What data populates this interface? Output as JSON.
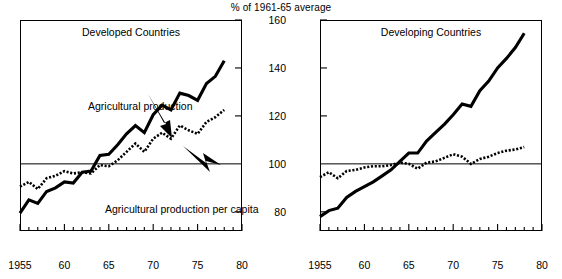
{
  "figure": {
    "suptitle": "% of 1961-65 average",
    "ylabels": [
      "160",
      "140",
      "120",
      "100",
      "80"
    ],
    "annotation_production": "Agricultural production",
    "annotation_per_capita": "Agricultural production per capita",
    "xlabels": [
      "1955",
      "60",
      "65",
      "70",
      "75",
      "80"
    ]
  },
  "panels": {
    "left": {
      "title": "Developed Countries"
    },
    "right": {
      "title": "Developing Countries"
    }
  },
  "chart_data": {
    "type": "line",
    "title": "% of 1961-65 average",
    "xlabel": "",
    "ylabel": "% of 1961-65 average",
    "xlim": [
      1955,
      1980
    ],
    "ylim": [
      72,
      160
    ],
    "yticks": [
      80,
      100,
      120,
      140,
      160
    ],
    "xticks": [
      1955,
      1960,
      1965,
      1970,
      1975,
      1980
    ],
    "xtick_labels": [
      "1955",
      "60",
      "65",
      "70",
      "75",
      "80"
    ],
    "grid": false,
    "legend": "none",
    "reference_line": 100,
    "annotations": [
      {
        "text": "Agricultural production",
        "panel": "left",
        "points_to": "solid-line"
      },
      {
        "text": "Agricultural production per capita",
        "panel": "left",
        "points_to": "dotted-line"
      }
    ],
    "panels": [
      {
        "name": "Developed Countries",
        "x": [
          1955,
          1956,
          1957,
          1958,
          1959,
          1960,
          1961,
          1962,
          1963,
          1964,
          1965,
          1966,
          1967,
          1968,
          1969,
          1970,
          1971,
          1972,
          1973,
          1974,
          1975,
          1976,
          1977,
          1978
        ],
        "series": [
          {
            "name": "Agricultural production",
            "style": "solid",
            "values": [
              79.5,
              85.0,
              83.5,
              88.5,
              90.0,
              92.5,
              92.0,
              96.5,
              97.0,
              103.5,
              104.0,
              108.0,
              112.5,
              116.0,
              113.0,
              120.5,
              124.5,
              122.5,
              129.5,
              128.5,
              126.5,
              133.5,
              136.5,
              143.0
            ]
          },
          {
            "name": "Agricultural production per capita",
            "style": "dotted",
            "values": [
              90.5,
              92.5,
              89.5,
              94.0,
              95.0,
              97.0,
              96.0,
              96.5,
              96.0,
              99.5,
              99.0,
              101.5,
              105.0,
              108.5,
              105.0,
              110.5,
              113.0,
              110.5,
              116.0,
              114.0,
              112.5,
              117.5,
              119.5,
              122.5
            ]
          }
        ]
      },
      {
        "name": "Developing Countries",
        "x": [
          1955,
          1956,
          1957,
          1958,
          1959,
          1960,
          1961,
          1962,
          1963,
          1964,
          1965,
          1966,
          1967,
          1968,
          1969,
          1970,
          1971,
          1972,
          1973,
          1974,
          1975,
          1976,
          1977,
          1978
        ],
        "series": [
          {
            "name": "Agricultural production",
            "style": "solid",
            "values": [
              78.0,
              80.5,
              81.5,
              86.0,
              88.5,
              90.5,
              92.5,
              95.0,
              97.5,
              101.0,
              104.5,
              104.5,
              109.5,
              113.0,
              116.5,
              120.5,
              125.0,
              124.0,
              130.5,
              134.5,
              140.0,
              144.0,
              148.5,
              154.5
            ]
          },
          {
            "name": "Agricultural production per capita",
            "style": "dotted",
            "values": [
              94.5,
              96.5,
              94.0,
              97.0,
              97.5,
              98.5,
              99.0,
              99.0,
              99.5,
              100.5,
              100.0,
              98.0,
              100.5,
              101.0,
              102.5,
              104.0,
              103.0,
              100.0,
              102.0,
              103.0,
              104.5,
              105.5,
              106.0,
              107.0
            ]
          }
        ]
      }
    ]
  }
}
